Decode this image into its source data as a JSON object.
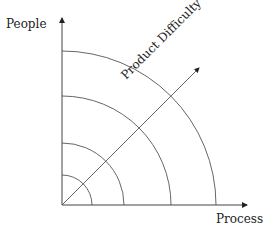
{
  "diagram": {
    "y_axis_label": "People",
    "x_axis_label": "Process",
    "diagonal_label": "Product Difficulty",
    "arcs": [
      {
        "radius": 30
      },
      {
        "radius": 62
      },
      {
        "radius": 109
      },
      {
        "radius": 154
      }
    ],
    "colors": {
      "line": "#555555",
      "text": "#222222"
    }
  }
}
